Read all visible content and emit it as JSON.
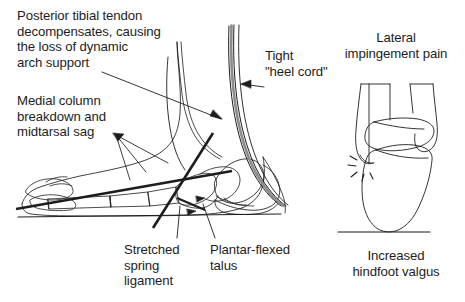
{
  "diagram": {
    "background_color": "#ffffff",
    "ink_color": "#1d1d1d",
    "labels": {
      "posterior_tibial_tendon": "Posterior tibial tendon\ndecompensates, causing\nthe loss of dynamic\narch support",
      "medial_column": "Medial column\nbreakdown and\nmidtarsal sag",
      "tight_heel_cord": "Tight\n\"heel cord\"",
      "stretched_spring_ligament": "Stretched\nspring\nligament",
      "plantar_flexed_talus": "Plantar-flexed\ntalus",
      "lateral_impingement_pain": "Lateral\nimpingement pain",
      "increased_hindfoot_valgus": "Increased\nhindfoot valgus"
    },
    "views": {
      "lateral_foot": "Lateral (sagittal) view of the left foot and ankle showing collapsed medial arch",
      "posterior_ankle": "Posterior (coronal) view of the hindfoot showing valgus alignment"
    },
    "annotations": {
      "pain_marker": "radiating spark lines at fibula-calcaneus contact"
    }
  }
}
